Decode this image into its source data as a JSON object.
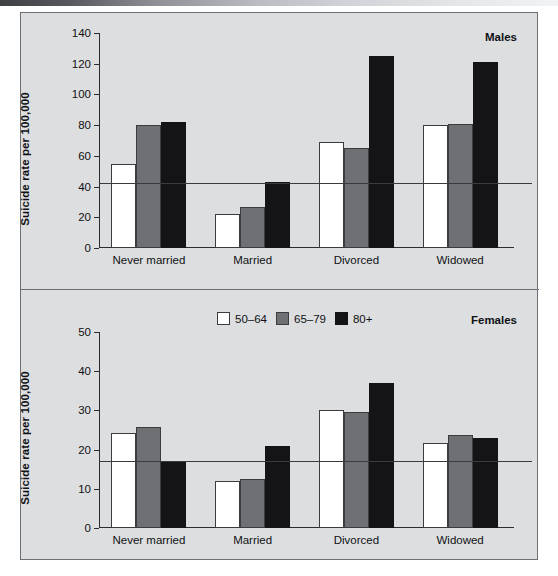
{
  "figure": {
    "background": "#dcdee0",
    "border_color": "#6c6f73"
  },
  "legend": {
    "items": [
      {
        "label": "50–64",
        "color": "#ffffff",
        "key": "c50"
      },
      {
        "label": "65–79",
        "color": "#6e7073",
        "key": "c65"
      },
      {
        "label": "80+",
        "color": "#141416",
        "key": "c80"
      }
    ]
  },
  "chart_data": [
    {
      "type": "bar",
      "panel": "males",
      "title": "Males",
      "xlabel": "",
      "ylabel": "Suicide rate per 100,000",
      "categories": [
        "Never married",
        "Married",
        "Divorced",
        "Widowed"
      ],
      "ylim": [
        0,
        140
      ],
      "yticks": [
        0,
        20,
        40,
        60,
        80,
        100,
        120,
        140
      ],
      "grid": false,
      "reference_line": 42,
      "series": [
        {
          "name": "50–64",
          "color": "#ffffff",
          "values": [
            55,
            22,
            69,
            80
          ]
        },
        {
          "name": "65–79",
          "color": "#6e7073",
          "values": [
            80,
            27,
            65,
            81
          ]
        },
        {
          "name": "80+",
          "color": "#141416",
          "values": [
            82,
            43,
            125,
            121
          ]
        }
      ]
    },
    {
      "type": "bar",
      "panel": "females",
      "title": "Females",
      "xlabel": "",
      "ylabel": "Suicide rate per 100,000",
      "categories": [
        "Never married",
        "Married",
        "Divorced",
        "Widowed"
      ],
      "ylim": [
        0,
        50
      ],
      "yticks": [
        0,
        10,
        20,
        30,
        40,
        50
      ],
      "grid": false,
      "reference_line": 16.8,
      "series": [
        {
          "name": "50–64",
          "color": "#ffffff",
          "values": [
            24.2,
            12,
            30.2,
            21.6
          ]
        },
        {
          "name": "65–79",
          "color": "#6e7073",
          "values": [
            25.8,
            12.5,
            29.6,
            23.8
          ]
        },
        {
          "name": "80+",
          "color": "#141416",
          "values": [
            17,
            21,
            37,
            23
          ]
        }
      ]
    }
  ]
}
